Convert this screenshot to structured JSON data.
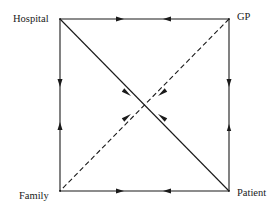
{
  "diagram": {
    "type": "directed-graph",
    "layout": "square-with-diagonals",
    "colors": {
      "line": "#1a1a1a",
      "background": "#ffffff"
    },
    "nodes": [
      {
        "id": "hospital",
        "label": "Hospital",
        "position": "top-left"
      },
      {
        "id": "gp",
        "label": "GP",
        "position": "top-right"
      },
      {
        "id": "family",
        "label": "Family",
        "position": "bottom-left"
      },
      {
        "id": "patient",
        "label": "Patient",
        "position": "bottom-right"
      }
    ],
    "edges": [
      {
        "from": "hospital",
        "to": "gp",
        "style": "solid",
        "arrows": "both-inward"
      },
      {
        "from": "family",
        "to": "patient",
        "style": "solid",
        "arrows": "both-inward"
      },
      {
        "from": "hospital",
        "to": "family",
        "style": "solid",
        "arrows": "both-inward"
      },
      {
        "from": "gp",
        "to": "patient",
        "style": "solid",
        "arrows": "both-inward"
      },
      {
        "from": "hospital",
        "to": "patient",
        "style": "solid",
        "arrows": "both-inward"
      },
      {
        "from": "gp",
        "to": "family",
        "style": "dashed",
        "arrows": "both-inward"
      }
    ]
  }
}
